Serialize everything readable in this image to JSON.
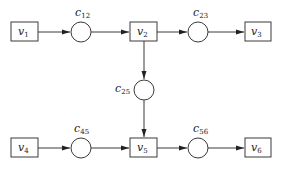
{
  "diagram": {
    "type": "flow-network",
    "nodes": [
      {
        "id": "v1",
        "label": "v",
        "sub": "1",
        "shape": "box",
        "x": 24.5,
        "y": 31.5
      },
      {
        "id": "v2",
        "label": "v",
        "sub": "2",
        "shape": "box",
        "x": 143.5,
        "y": 31.5
      },
      {
        "id": "v3",
        "label": "v",
        "sub": "3",
        "shape": "box",
        "x": 258,
        "y": 31.5
      },
      {
        "id": "v4",
        "label": "v",
        "sub": "4",
        "shape": "box",
        "x": 24.5,
        "y": 147.5
      },
      {
        "id": "v5",
        "label": "v",
        "sub": "5",
        "shape": "box",
        "x": 143.5,
        "y": 147.5
      },
      {
        "id": "v6",
        "label": "v",
        "sub": "6",
        "shape": "box",
        "x": 258,
        "y": 147.5
      }
    ],
    "connectors": [
      {
        "id": "c12",
        "label": "c",
        "sub": "12",
        "shape": "circle",
        "x": 81,
        "y": 32,
        "from": "v1",
        "to": "v2"
      },
      {
        "id": "c23",
        "label": "c",
        "sub": "23",
        "shape": "circle",
        "x": 198,
        "y": 32,
        "from": "v2",
        "to": "v3"
      },
      {
        "id": "c25",
        "label": "c",
        "sub": "25",
        "shape": "circle",
        "x": 144,
        "y": 90,
        "from": "v2",
        "to": "v5"
      },
      {
        "id": "c45",
        "label": "c",
        "sub": "45",
        "shape": "circle",
        "x": 81,
        "y": 148,
        "from": "v4",
        "to": "v5"
      },
      {
        "id": "c56",
        "label": "c",
        "sub": "56",
        "shape": "circle",
        "x": 198,
        "y": 148,
        "from": "v5",
        "to": "v6"
      }
    ],
    "colors": {
      "stroke": "#3a3a3a",
      "background": "#ffffff"
    }
  }
}
